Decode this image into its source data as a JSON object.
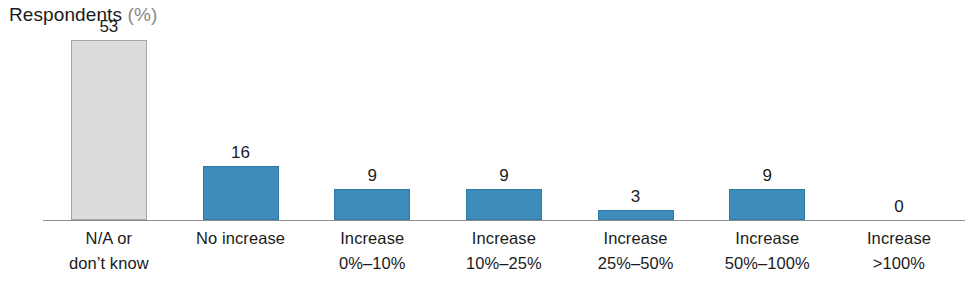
{
  "chart_data": {
    "type": "bar",
    "title_main": "Respondents",
    "title_unit": "(%)",
    "xlabel": "",
    "ylabel": "Respondents (%)",
    "ylim": [
      0,
      56
    ],
    "grid": false,
    "legend": "none",
    "axis": {
      "baseline_visible": true,
      "y_axis_visible": false,
      "tick_labels": []
    },
    "categories": [
      "N/A or don't know",
      "No increase",
      "Increase 0%–10%",
      "Increase 10%–25%",
      "Increase 25%–50%",
      "Increase 50%–100%",
      "Increase >100%"
    ],
    "values": [
      53,
      16,
      9,
      9,
      3,
      9,
      0
    ],
    "bars": [
      {
        "label_line1": "N/A or",
        "label_line2": "don’t know",
        "value": 53,
        "value_text": "53",
        "color": "#dcdcdc",
        "border_color": "#a5a5a5",
        "style": "gray"
      },
      {
        "label_line1": "No increase",
        "label_line2": "",
        "value": 16,
        "value_text": "16",
        "color": "#3e8cbc",
        "border_color": "#2f7aa8",
        "style": "blue"
      },
      {
        "label_line1": "Increase",
        "label_line2": "0%–10%",
        "value": 9,
        "value_text": "9",
        "color": "#3e8cbc",
        "border_color": "#2f7aa8",
        "style": "blue"
      },
      {
        "label_line1": "Increase",
        "label_line2": "10%–25%",
        "value": 9,
        "value_text": "9",
        "color": "#3e8cbc",
        "border_color": "#2f7aa8",
        "style": "blue"
      },
      {
        "label_line1": "Increase",
        "label_line2": "25%–50%",
        "value": 3,
        "value_text": "3",
        "color": "#3e8cbc",
        "border_color": "#2f7aa8",
        "style": "blue"
      },
      {
        "label_line1": "Increase",
        "label_line2": "50%–100%",
        "value": 9,
        "value_text": "9",
        "color": "#3e8cbc",
        "border_color": "#2f7aa8",
        "style": "blue"
      },
      {
        "label_line1": "Increase",
        "label_line2": ">100%",
        "value": 0,
        "value_text": "0",
        "color": "#3e8cbc",
        "border_color": "#2f7aa8",
        "style": "empty"
      }
    ]
  },
  "colors": {
    "blue": "#3e8cbc",
    "blue_border": "#2f7aa8",
    "gray": "#dcdcdc",
    "gray_border": "#a5a5a5",
    "axis": "#8d8d8d",
    "text": "#1b1b1b",
    "text_muted": "#8a8a8a",
    "background": "#ffffff"
  }
}
